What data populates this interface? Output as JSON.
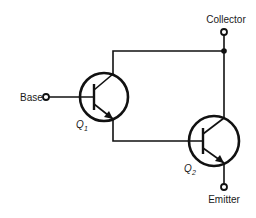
{
  "diagram": {
    "terminals": {
      "base": "Base",
      "collector": "Collector",
      "emitter": "Emitter"
    },
    "transistors": [
      {
        "id": "Q1",
        "label": "Q",
        "subscript": "1",
        "type": "NPN"
      },
      {
        "id": "Q2",
        "label": "Q",
        "subscript": "2",
        "type": "NPN"
      }
    ],
    "connections": [
      "Base -> Q1 base",
      "Q1 collector -> Collector node",
      "Q1 emitter -> Q2 base",
      "Q2 collector -> Collector node",
      "Q2 emitter -> Emitter"
    ],
    "colors": {
      "ink": "#111111",
      "background": "#ffffff"
    }
  }
}
